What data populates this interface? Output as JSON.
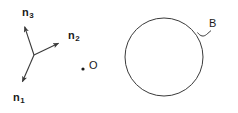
{
  "figure": {
    "background_color": "#ffffff",
    "stroke_color": "#3a3a3a",
    "text_color": "#1a1a1a"
  },
  "basis_vectors": {
    "origin": {
      "x": 34,
      "y": 55
    },
    "items": [
      {
        "name": "n1",
        "label": "n",
        "subscript": "1",
        "tip": {
          "x": 21,
          "y": 85
        },
        "label_pos": {
          "x": 13,
          "y": 92
        }
      },
      {
        "name": "n2",
        "label": "n",
        "subscript": "2",
        "tip": {
          "x": 63,
          "y": 41
        },
        "label_pos": {
          "x": 68,
          "y": 30
        }
      },
      {
        "name": "n3",
        "label": "n",
        "subscript": "3",
        "tip": {
          "x": 23,
          "y": 23
        },
        "label_pos": {
          "x": 22,
          "y": 7
        }
      }
    ]
  },
  "origin_point": {
    "name": "O",
    "label": "O",
    "dot": {
      "x": 83,
      "y": 69,
      "r": 1.6
    },
    "label_pos": {
      "x": 89,
      "y": 60
    }
  },
  "body": {
    "name": "B",
    "label": "B",
    "circle": {
      "cx": 164,
      "cy": 57,
      "r": 39
    },
    "leader_path": "M 197.5 32.5 C 200.5 36.5 203.5 37 206.5 34.5 C 208.5 32.8 209.8 31.6 211 30.6",
    "label_pos": {
      "x": 209,
      "y": 18
    }
  }
}
